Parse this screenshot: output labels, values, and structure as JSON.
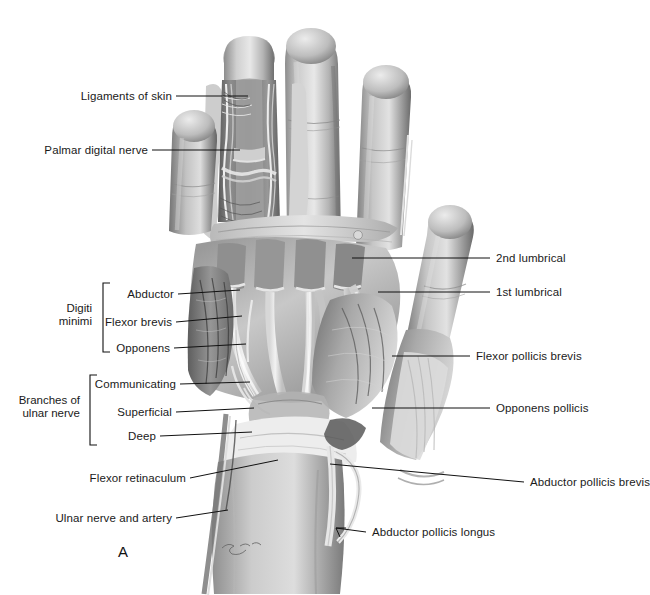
{
  "figure": {
    "type": "anatomical-illustration",
    "panel_label": "A",
    "style": "grayscale pencil/airbrush medical illustration on white background",
    "background_color": "#ffffff",
    "label_color": "#1a1a1a",
    "leader_line_color": "#111111"
  },
  "labels": {
    "ligaments_of_skin": "Ligaments of skin",
    "palmar_digital_nerve": "Palmar digital nerve",
    "abductor": "Abductor",
    "flexor_brevis": "Flexor brevis",
    "opponens": "Opponens",
    "communicating": "Communicating",
    "superficial": "Superficial",
    "deep": "Deep",
    "flexor_retinaculum": "Flexor retinaculum",
    "ulnar_nerve_and_artery": "Ulnar nerve and artery",
    "second_lumbrical": "2nd lumbrical",
    "first_lumbrical": "1st lumbrical",
    "flexor_pollicis_brevis": "Flexor pollicis brevis",
    "opponens_pollicis": "Opponens pollicis",
    "abductor_pollicis_brevis": "Abductor pollicis brevis",
    "abductor_pollicis_longus": "Abductor pollicis longus"
  },
  "groups": {
    "digiti_minimi": {
      "line1": "Digiti",
      "line2": "minimi"
    },
    "branches_of_ulnar_nerve": {
      "line1": "Branches of",
      "line2": "ulnar nerve"
    }
  }
}
